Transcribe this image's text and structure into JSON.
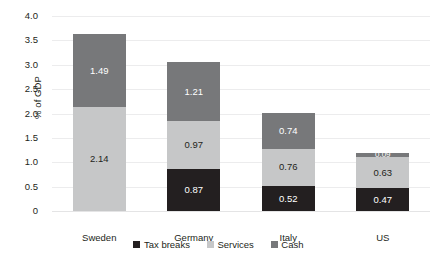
{
  "chart_data": {
    "type": "bar",
    "subtype": "stacked-bar",
    "title": "",
    "xlabel": "",
    "ylabel": "% of GDP",
    "ylim": [
      0,
      4.0
    ],
    "ytick_step": 0.5,
    "ytick_labels": [
      "4.0",
      "3.5",
      "3.0",
      "2.5",
      "2.0",
      "1.5",
      "1.0",
      "0.5",
      "0"
    ],
    "ytick_values": [
      4.0,
      3.5,
      3.0,
      2.5,
      2.0,
      1.5,
      1.0,
      0.5,
      0
    ],
    "grid": true,
    "grid_axis": "y",
    "legend_position": "bottom",
    "categories": [
      "Sweden",
      "Germany",
      "Italy",
      "US"
    ],
    "series": [
      {
        "name": "Tax breaks",
        "color": "#231f20",
        "values": [
          null,
          0.87,
          0.52,
          0.47
        ],
        "labels": [
          "",
          "0.87",
          "0.52",
          "0.47"
        ]
      },
      {
        "name": "Services",
        "color": "#c6c7c8",
        "values": [
          2.14,
          0.97,
          0.76,
          0.63
        ],
        "labels": [
          "2.14",
          "0.97",
          "0.76",
          "0.63"
        ]
      },
      {
        "name": "Cash",
        "color": "#77787a",
        "values": [
          1.49,
          1.21,
          0.74,
          0.09
        ],
        "labels": [
          "1.49",
          "1.21",
          "0.74",
          "0.09"
        ]
      }
    ],
    "totals": [
      3.63,
      3.05,
      2.02,
      1.19
    ]
  },
  "legend": {
    "items": [
      {
        "label": "Tax breaks",
        "color": "#231f20"
      },
      {
        "label": "Services",
        "color": "#c6c7c8"
      },
      {
        "label": "Cash",
        "color": "#77787a"
      }
    ]
  },
  "axes": {
    "y_title": "% of GDP"
  }
}
